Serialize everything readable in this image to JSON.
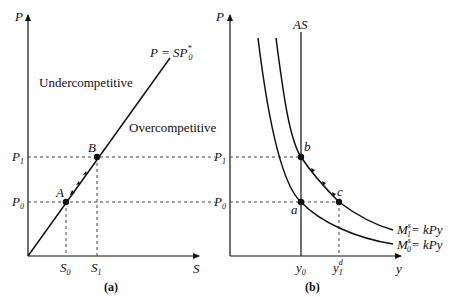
{
  "panel_a": {
    "caption": "(a)",
    "y_axis_label": "P",
    "x_axis_label": "S",
    "line_label_main": "P = SP",
    "line_label_sup": "*",
    "line_label_sub": "0",
    "region_upper": "Undercompetitive",
    "region_lower": "Overcompetitive",
    "point_a": "A",
    "point_b": "B",
    "p1_main": "P",
    "p1_sub": "1",
    "p0_main": "P",
    "p0_sub": "0",
    "s0_main": "S",
    "s0_sub": "0",
    "s1_main": "S",
    "s1_sub": "1"
  },
  "panel_b": {
    "caption": "(b)",
    "y_axis_label": "P",
    "x_axis_label": "y",
    "as_label": "AS",
    "point_a": "a",
    "point_b": "b",
    "point_c": "c",
    "p1_main": "P",
    "p1_sub": "1",
    "p0_main": "P",
    "p0_sub": "0",
    "y0_main": "y",
    "y0_sub": "0",
    "y1_main": "y",
    "y1_sub": "1",
    "y1_sup": "d",
    "curve1_main": "M",
    "curve1_sub": "1",
    "curve1_sup": "s",
    "curve1_rhs": "= kPy",
    "curve0_main": "M",
    "curve0_sub": "0",
    "curve0_sup": "s",
    "curve0_rhs": "= kPy"
  },
  "colors": {
    "ink": "#111111",
    "dash": "#444444"
  }
}
